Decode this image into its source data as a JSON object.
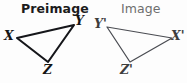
{
  "figure": {
    "kind": "geometry-transformation-diagram",
    "background_color": "#fdfdfd",
    "width": 187,
    "height": 83
  },
  "titles": {
    "preimage": "Preimage",
    "image": "Image",
    "preimage_color": "#1c1c1c",
    "image_color": "#6e6e6e"
  },
  "shapes": [
    {
      "name": "preimage-triangle",
      "label": "Preimage",
      "stroke_color": "#15161a",
      "stroke_width": 2.1,
      "vertices": [
        {
          "label": "X",
          "x": 17,
          "y": 38
        },
        {
          "label": "Y",
          "x": 74,
          "y": 25
        },
        {
          "label": "Z",
          "x": 48,
          "y": 62
        }
      ]
    },
    {
      "name": "image-triangle",
      "label": "Image",
      "stroke_color": "#4a4c52",
      "stroke_width": 1.25,
      "vertices": [
        {
          "label": "Y'",
          "x": 107,
          "y": 27
        },
        {
          "label": "X'",
          "x": 172,
          "y": 38
        },
        {
          "label": "Z'",
          "x": 130,
          "y": 62
        }
      ]
    }
  ],
  "vertex_labels": {
    "x": "X",
    "y": "Y",
    "z": "Z",
    "x_prime": "X'",
    "y_prime": "Y'",
    "z_prime": "Z'"
  }
}
